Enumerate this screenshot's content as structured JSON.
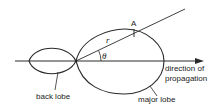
{
  "diagram": {
    "labels": {
      "point": "A",
      "radius": "r",
      "angle": "θ",
      "direction_line1": "direction of",
      "direction_line2": "propagation",
      "back_lobe": "back lobe",
      "major_lobe": "major lobe"
    },
    "colors": {
      "line": "#2a2a2a",
      "text": "#222222",
      "background": "#ffffff"
    },
    "geometry": {
      "origin": [
        76,
        61
      ],
      "axis": {
        "x_start": 15,
        "x_end": 203,
        "y": 61
      },
      "back_lobe": {
        "x_left": 29,
        "x_right": 76,
        "half_height": 13
      },
      "major_lobe": {
        "x_left": 76,
        "x_right": 164,
        "top": 29,
        "bottom": 94
      },
      "ray_end": [
        185,
        9
      ],
      "point_A": [
        134,
        33
      ]
    }
  }
}
